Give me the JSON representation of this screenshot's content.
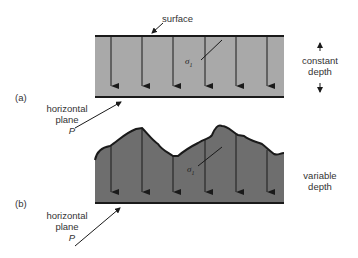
{
  "figure": {
    "panels": [
      {
        "id": "a",
        "label": "(a)",
        "surface_label": "surface",
        "stress_label": "σ",
        "stress_subscript": "1",
        "depth_label_line1": "constant",
        "depth_label_line2": "depth",
        "plane_label_line1": "horizontal",
        "plane_label_line2": "plane",
        "plane_symbol": "P",
        "fill_color": "#a9a9a9"
      },
      {
        "id": "b",
        "label": "(b)",
        "stress_label": "σ",
        "stress_subscript": "1",
        "depth_label_line1": "variable",
        "depth_label_line2": "depth",
        "plane_label_line1": "horizontal",
        "plane_label_line2": "plane",
        "plane_symbol": "P",
        "fill_color": "#6e6e6e"
      }
    ],
    "arrow_count_per_panel": 6
  }
}
